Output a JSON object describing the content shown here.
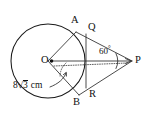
{
  "figure": {
    "background_color": "#ffffff",
    "stroke_color": "#1a1a1a",
    "labels": {
      "center": "O",
      "point_a": "A",
      "point_b": "B",
      "point_q": "Q",
      "point_r": "R",
      "point_p": "P",
      "angle": "60",
      "degree_symbol": "°",
      "radius_number": "8",
      "radius_sqrt_symbol": "√",
      "radius_radicand": "3",
      "radius_unit": "cm"
    },
    "geometry": {
      "circle_center_x": 48,
      "circle_center_y": 61,
      "circle_radius": 37,
      "point_a_x": 76,
      "point_a_y": 32,
      "point_b_x": 79,
      "point_b_y": 95,
      "point_p_x": 132,
      "point_p_y": 61,
      "point_q_x": 86,
      "point_q_y": 34,
      "point_r_x": 86,
      "point_r_y": 88,
      "angle_at_p_degrees": 60,
      "radius_label_value": "8√3 cm"
    }
  }
}
